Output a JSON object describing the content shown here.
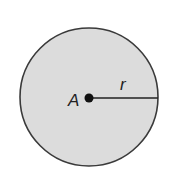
{
  "diagram": {
    "shape": "circle",
    "center_label": "A",
    "radius_label": "r",
    "colors": {
      "fill": "#dcdcdc",
      "stroke": "#3a3a3a",
      "point": "#111111"
    }
  }
}
